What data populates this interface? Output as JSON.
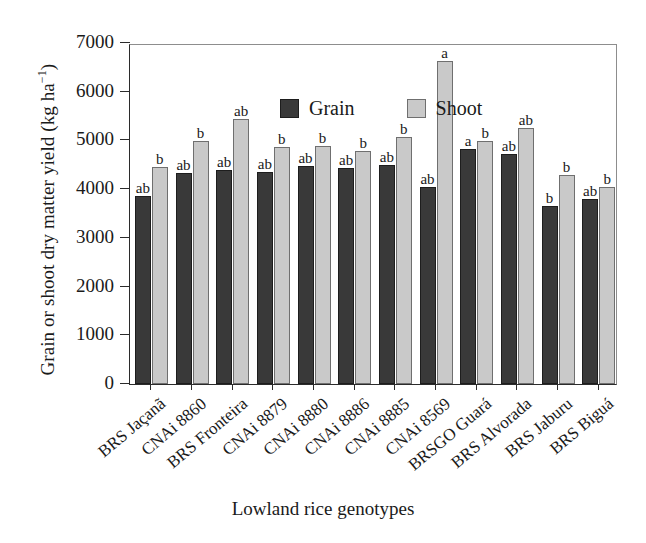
{
  "chart_data": {
    "type": "bar",
    "title": "",
    "xlabel": "Lowland rice genotypes",
    "ylabel": "Grain or shoot dry matter yield (kg ha⁻¹)",
    "ylim": [
      0,
      7000
    ],
    "yticks": [
      0,
      1000,
      2000,
      3000,
      4000,
      5000,
      6000,
      7000
    ],
    "ytick_labels": [
      "0",
      "1000",
      "2000",
      "3000",
      "4000",
      "5000",
      "6000",
      "7000"
    ],
    "grid": false,
    "legend_position": "top-left-inside",
    "categories": [
      "BRS Jaçanã",
      "CNAi 8860",
      "BRS Fronteira",
      "CNAi 8879",
      "CNAi 8880",
      "CNAi 8886",
      "CNAi 8885",
      "CNAi 8569",
      "BRSGO Guará",
      "BRS Alvorada",
      "BRS Jaburu",
      "BRS Biguá"
    ],
    "series": [
      {
        "name": "Grain",
        "color": "#393939",
        "values": [
          3850,
          4330,
          4390,
          4360,
          4470,
          4440,
          4490,
          4050,
          4830,
          4720,
          3650,
          3800
        ],
        "annotations": [
          "ab",
          "ab",
          "ab",
          "ab",
          "ab",
          "ab",
          "ab",
          "ab",
          "a",
          "ab",
          "b",
          "ab"
        ]
      },
      {
        "name": "Shoot",
        "color": "#c9c9c9",
        "values": [
          4450,
          4980,
          5430,
          4860,
          4890,
          4790,
          5070,
          6630,
          4990,
          5250,
          4290,
          4050
        ],
        "annotations": [
          "b",
          "b",
          "ab",
          "b",
          "b",
          "b",
          "b",
          "a",
          "b",
          "ab",
          "b",
          "b"
        ]
      }
    ]
  },
  "legend": {
    "items": [
      {
        "label": "Grain",
        "swatch": "dark-square-swatch"
      },
      {
        "label": "Shoot",
        "swatch": "light-square-swatch"
      }
    ]
  }
}
